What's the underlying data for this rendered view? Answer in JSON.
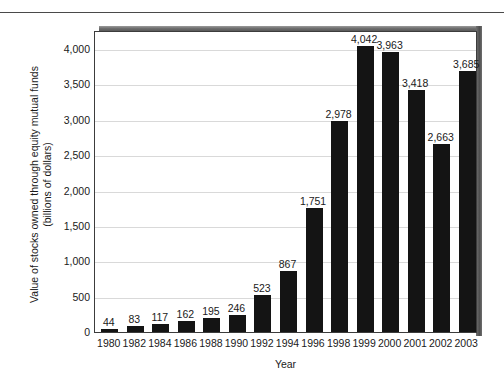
{
  "chart_data": {
    "type": "bar",
    "title": "",
    "xlabel": "Year",
    "ylabel": "Value of stocks owned through equity mutual funds (billions of dollars)",
    "ylabel_lines": [
      "Value of stocks owned through equity mutual funds",
      "(billions of dollars)"
    ],
    "categories": [
      "1980",
      "1982",
      "1984",
      "1986",
      "1988",
      "1990",
      "1992",
      "1994",
      "1996",
      "1998",
      "1999",
      "2000",
      "2001",
      "2002",
      "2003"
    ],
    "values": [
      44,
      83,
      117,
      162,
      195,
      246,
      523,
      867,
      1751,
      2978,
      4042,
      3963,
      3418,
      2663,
      3685
    ],
    "value_labels": [
      "44",
      "83",
      "117",
      "162",
      "195",
      "246",
      "523",
      "867",
      "1,751",
      "2,978",
      "4,042",
      "3,963",
      "3,418",
      "2,663",
      "3,685"
    ],
    "ylim": [
      0,
      4270
    ],
    "yticks": [
      0,
      500,
      1000,
      1500,
      2000,
      2500,
      3000,
      3500,
      4000
    ],
    "ytick_labels": [
      "0",
      "500",
      "1,000",
      "1,500",
      "2,000",
      "2,500",
      "3,000",
      "3,500",
      "4,000"
    ],
    "grid": true,
    "grid_axis": "y",
    "legend": false,
    "bar_color": "#141414",
    "grid_color": "#d9d9d9",
    "axis_color": "#3c3c3c",
    "background_color": "#ffffff"
  }
}
